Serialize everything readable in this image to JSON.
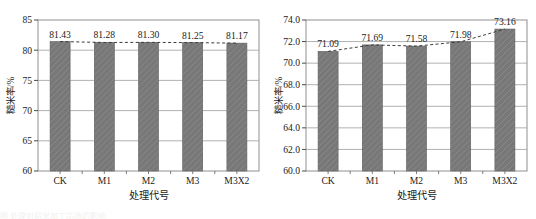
{
  "figure": {
    "panel_count": 2,
    "background_color": "#ffffff",
    "bar_color": "#787878",
    "bar_edge_color": "#5a5a5a",
    "trendline_color": "#3c3c3c",
    "gridline_color": "#a8a8a8",
    "caption_partial": "图        处理对稻米加工品质的影响"
  },
  "chart_data": [
    {
      "type": "bar",
      "panel": "left",
      "title": "",
      "subtitle": "",
      "categories": [
        "CK",
        "M1",
        "M2",
        "M3",
        "M3X2"
      ],
      "values": [
        81.43,
        81.28,
        81.3,
        81.25,
        81.17
      ],
      "data_labels": [
        "81.43",
        "81.28",
        "81.30",
        "81.25",
        "81.17"
      ],
      "series": [
        {
          "name": "糙米率",
          "values": [
            81.43,
            81.28,
            81.3,
            81.25,
            81.17
          ]
        }
      ],
      "xlabel": "处理代号",
      "ylabel": "糙米率/%",
      "ylim": [
        60,
        85
      ],
      "ytick_values": [
        60,
        65,
        70,
        75,
        80,
        85
      ],
      "ytick_labels": [
        "60",
        "65",
        "70",
        "75",
        "80",
        "85"
      ],
      "ytick_step": 5,
      "grid": true,
      "grid_axis": "y",
      "legend": false,
      "legend_position": "none",
      "overlay": {
        "type": "line",
        "style": "dashed",
        "connects": "bar-tops"
      }
    },
    {
      "type": "bar",
      "panel": "right",
      "title": "",
      "subtitle": "",
      "categories": [
        "CK",
        "M1",
        "M2",
        "M3",
        "M3X2"
      ],
      "values": [
        71.09,
        71.69,
        71.58,
        71.98,
        73.16
      ],
      "data_labels": [
        "71.09",
        "71.69",
        "71.58",
        "71.98",
        "73.16"
      ],
      "series": [
        {
          "name": "糙米率",
          "values": [
            71.09,
            71.69,
            71.58,
            71.98,
            73.16
          ]
        }
      ],
      "xlabel": "处理代号",
      "ylabel": "糙米率/%",
      "ylim": [
        60.0,
        74.0
      ],
      "ytick_values": [
        60.0,
        62.0,
        64.0,
        66.0,
        68.0,
        70.0,
        72.0,
        74.0
      ],
      "ytick_labels": [
        "60.0",
        "62.0",
        "64.0",
        "66.0",
        "68.0",
        "70.0",
        "72.0",
        "74.0"
      ],
      "ytick_step": 2.0,
      "grid": true,
      "grid_axis": "y",
      "legend": false,
      "legend_position": "none",
      "overlay": {
        "type": "line",
        "style": "dashed",
        "connects": "bar-tops"
      }
    }
  ]
}
